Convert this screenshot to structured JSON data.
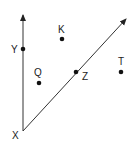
{
  "diagram": {
    "title": "",
    "vertex": {
      "label": "X"
    },
    "rays": [
      {
        "name": "ray-XY",
        "from": "X",
        "through": "Y"
      },
      {
        "name": "ray-XZ",
        "from": "X",
        "through": "Z"
      }
    ],
    "points": [
      {
        "label": "Y",
        "on": "ray-XY"
      },
      {
        "label": "K",
        "on": "interior"
      },
      {
        "label": "Q",
        "on": "interior"
      },
      {
        "label": "Z",
        "on": "ray-XZ"
      },
      {
        "label": "T",
        "on": "exterior"
      }
    ],
    "colors": {
      "line": "#333333",
      "point": "#111111",
      "text": "#222222"
    }
  }
}
